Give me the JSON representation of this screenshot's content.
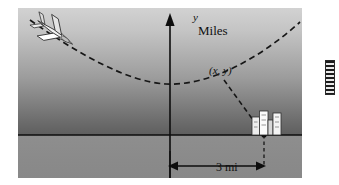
{
  "figure": {
    "type": "coordinate-diagram",
    "axes": {
      "y_axis_label": "y",
      "y_axis_unit_label": "Miles",
      "x_axis_label": "x"
    },
    "annotations": {
      "point_label": "(x, y)",
      "distance_label": "3 mi"
    },
    "objects": {
      "airplane": "airplane-icon",
      "city": "buildings-icon",
      "path": "dashed-parabola",
      "sight_line": "dashed-line-segment",
      "drop_line": "dashed-vertical-line",
      "dimension": "double-headed-arrow"
    },
    "colors": {
      "sky_top": "#d2d2d2",
      "sky_bottom": "#5e5e5e",
      "ground": "#8a8a8a",
      "ink": "#101010",
      "aircraft_body": "#f0f0f0",
      "building_fill": "#efefef"
    }
  },
  "margin_artifact": {
    "name": "page-edge-marker"
  }
}
